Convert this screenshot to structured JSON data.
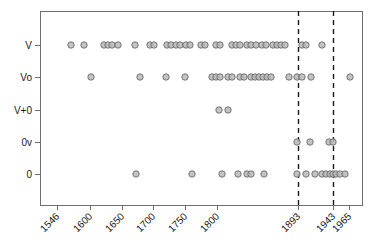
{
  "chart_data": {
    "type": "scatter",
    "title": "",
    "subtitle": "",
    "xlabel": "",
    "ylabel": "",
    "grid": false,
    "legend": "none",
    "xlim": [
      1546,
      1965
    ],
    "x_tick_labels": [
      "1546",
      "1600",
      "1650",
      "1700",
      "1750",
      "1800",
      "1893",
      "1943",
      "1965"
    ],
    "x_tick_values": [
      1546,
      1600,
      1650,
      1700,
      1750,
      1800,
      1893,
      1943,
      1965
    ],
    "x_tick_pixels": [
      57,
      90,
      122,
      153,
      185,
      217,
      298,
      333,
      349
    ],
    "y_categories": [
      "V",
      "Vo",
      "V+0",
      "0v",
      "0"
    ],
    "y_tick_pixels": [
      45,
      77,
      110,
      142,
      174
    ],
    "annotations": [
      {
        "type": "vline",
        "label": "1893",
        "value": 1893,
        "pixel": 298,
        "style": "dashed"
      },
      {
        "type": "vline",
        "label": "1943",
        "value": 1943,
        "pixel": 333,
        "style": "dashed"
      }
    ],
    "marker": {
      "shape": "circle",
      "radius": 3.2,
      "fill": "#b9b9b9",
      "stroke": "#6b6b6b"
    },
    "series": [
      {
        "name": "V",
        "category": "V",
        "y_pixel": 45,
        "x_pixels": [
          71,
          84,
          104,
          108,
          112,
          118,
          135,
          150,
          154,
          167,
          171,
          176,
          180,
          186,
          190,
          201,
          205,
          216,
          220,
          232,
          236,
          240,
          247,
          251,
          256,
          262,
          266,
          273,
          277,
          281,
          285,
          302,
          306,
          322
        ]
      },
      {
        "name": "Vo",
        "category": "Vo",
        "y_pixel": 77,
        "x_pixels": [
          91,
          140,
          166,
          185,
          212,
          216,
          220,
          228,
          232,
          240,
          244,
          251,
          255,
          259,
          263,
          267,
          271,
          289,
          297,
          302,
          311,
          350
        ]
      },
      {
        "name": "V+0",
        "category": "V+0",
        "y_pixel": 110,
        "x_pixels": [
          219,
          228
        ]
      },
      {
        "name": "0v",
        "category": "0v",
        "y_pixel": 142,
        "x_pixels": [
          297,
          310,
          329,
          333
        ]
      },
      {
        "name": "0",
        "category": "0",
        "y_pixel": 174,
        "x_pixels": [
          136,
          192,
          222,
          238,
          247,
          251,
          264,
          297,
          306,
          315,
          322,
          326,
          330,
          333,
          336,
          340,
          345
        ]
      }
    ]
  },
  "axes": {
    "frame": {
      "left": 40,
      "right": 362,
      "top": 11,
      "bottom": 205
    }
  }
}
